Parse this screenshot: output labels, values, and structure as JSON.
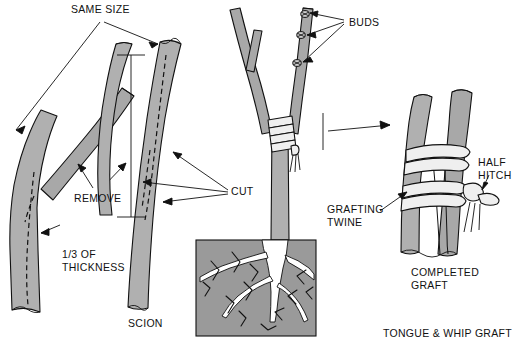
{
  "figure": {
    "title": "Tongue & Whip Graft",
    "caption": "TONGUE & WHIP GRAFT",
    "background_color": "#ffffff",
    "bark_color": "#b0b0b0",
    "soil_color": "#9a9a9a",
    "root_color": "#ffffff",
    "twine_color": "#efefef",
    "line_color": "#111111",
    "watermark": ""
  },
  "labels": {
    "same_size": "SAME SIZE",
    "remove": "REMOVE",
    "cut": "CUT",
    "thickness_line1": "1/3 OF",
    "thickness_line2": "THICKNESS",
    "scion": "SCION",
    "buds": "BUDS",
    "grafting_twine_line1": "GRAFTING",
    "grafting_twine_line2": "TWINE",
    "half_hitch_line1": "HALF",
    "half_hitch_line2": "HITCH",
    "completed_graft_line1": "COMPLETED",
    "completed_graft_line2": "GRAFT",
    "caption": "TONGUE & WHIP GRAFT"
  },
  "panels": [
    {
      "name": "rootstock",
      "label": "Rootstock with branch to remove"
    },
    {
      "name": "scion",
      "label": "SCION"
    },
    {
      "name": "grafted-tree",
      "label": "Grafted tree in soil"
    },
    {
      "name": "completed-graft",
      "label": "COMPLETED GRAFT"
    }
  ],
  "bud_count": 3
}
